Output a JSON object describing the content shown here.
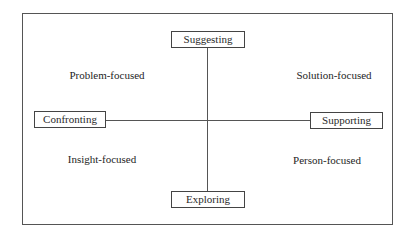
{
  "diagram": {
    "type": "two-axis quadrant diagram",
    "axes": {
      "vertical": {
        "top": "Suggesting",
        "bottom": "Exploring"
      },
      "horizontal": {
        "left": "Confronting",
        "right": "Supporting"
      }
    },
    "quadrants": {
      "top_left": "Problem-focused",
      "top_right": "Solution-focused",
      "bottom_left": "Insight-focused",
      "bottom_right": "Person-focused"
    },
    "colors": {
      "line": "#555555",
      "text": "#2a2a2a",
      "background": "#ffffff"
    }
  }
}
